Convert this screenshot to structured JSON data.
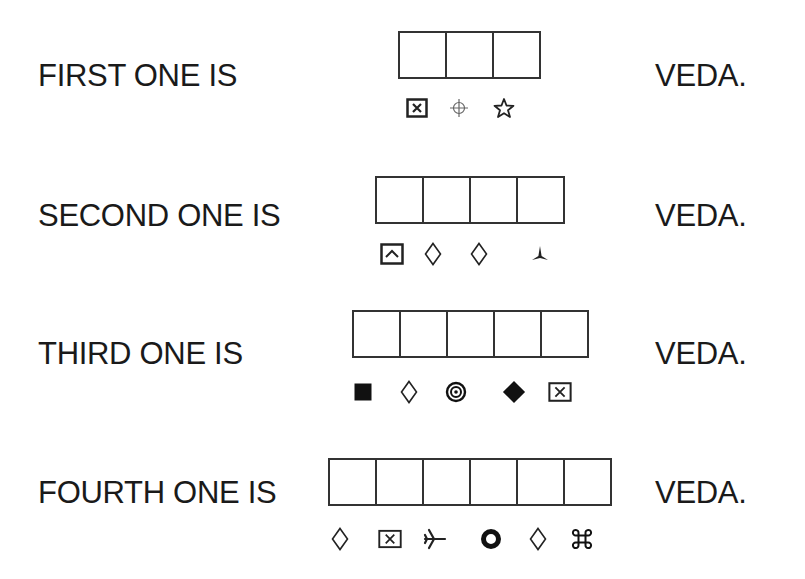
{
  "rows": [
    {
      "label": "FIRST ONE IS",
      "answer": "VEDA.",
      "box_count": 3,
      "symbols": [
        "boxed-x",
        "crosshair-circle",
        "star-outline"
      ]
    },
    {
      "label": "SECOND ONE IS",
      "answer": "VEDA.",
      "box_count": 4,
      "symbols": [
        "boxed-caret-up",
        "diamond-outline",
        "diamond-outline",
        "three-point-star"
      ]
    },
    {
      "label": "THIRD ONE IS",
      "answer": "VEDA.",
      "box_count": 5,
      "symbols": [
        "filled-square",
        "diamond-outline",
        "bullseye",
        "filled-diamond",
        "boxed-x"
      ]
    },
    {
      "label": "FOURTH ONE IS",
      "answer": "VEDA.",
      "box_count": 6,
      "symbols": [
        "diamond-outline",
        "boxed-x",
        "airplane",
        "thick-ring",
        "diamond-outline",
        "command-key"
      ]
    }
  ]
}
